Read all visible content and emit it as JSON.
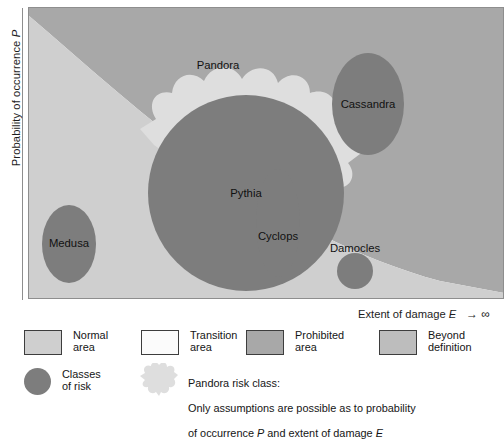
{
  "axes": {
    "y_label_prefix": "Probability of occurrence ",
    "y_label_symbol": "P",
    "x_label_prefix": "Extent of damage ",
    "x_label_symbol": "E",
    "x_label_arrow": "→ ∞"
  },
  "colors": {
    "normal_area": "#cfcfcf",
    "transition_area": "#fbfbfb",
    "prohibited_area": "#a8a8a8",
    "beyond_definition": "#bdbdbd",
    "pandora_blob": "#dedede",
    "risk_class_circle": "#7d7d7d",
    "label_text": "#111111",
    "plot_border": "#8e8e8e"
  },
  "chart_data": {
    "type": "diagram",
    "title": "",
    "xlabel": "Extent of damage E",
    "ylabel": "Probability of occurrence P",
    "regions": [
      {
        "name": "Normal area",
        "color": "#cfcfcf"
      },
      {
        "name": "Transition area",
        "color": "#fbfbfb"
      },
      {
        "name": "Prohibited area",
        "color": "#a8a8a8"
      },
      {
        "name": "Beyond definition",
        "color": "#bdbdbd"
      },
      {
        "name": "Pandora blob",
        "color": "#dedede"
      }
    ],
    "risk_classes": [
      {
        "name": "Pythia",
        "cx": 218,
        "cy": 186,
        "rx": 98,
        "ry": 98,
        "label_x": 218,
        "label_y": 190
      },
      {
        "name": "Cassandra",
        "cx": 340,
        "cy": 97,
        "rx": 36,
        "ry": 51,
        "label_x": 340,
        "label_y": 101
      },
      {
        "name": "Cyclops",
        "cx": 250,
        "cy": 216,
        "rx": 22,
        "ry": 54,
        "label_x": 250,
        "label_y": 233
      },
      {
        "name": "Medusa",
        "cx": 41,
        "cy": 237,
        "rx": 27,
        "ry": 39,
        "label_x": 41,
        "label_y": 240
      },
      {
        "name": "Damocles",
        "cx": 327,
        "cy": 264,
        "rx": 18,
        "ry": 18,
        "label_x": 327,
        "label_y": 245
      }
    ],
    "pandora_label": {
      "name": "Pandora",
      "label_x": 190,
      "label_y": 62
    }
  },
  "legend": {
    "row1": [
      {
        "swatch": "rect",
        "fill": "#cfcfcf",
        "label": "Normal\narea"
      },
      {
        "swatch": "rect",
        "fill": "#fbfbfb",
        "label": "Transition\narea"
      },
      {
        "swatch": "rect",
        "fill": "#a8a8a8",
        "label": "Prohibited\narea"
      },
      {
        "swatch": "rect",
        "fill": "#bdbdbd",
        "label": "Beyond\ndefinition"
      }
    ],
    "row2": {
      "classes_swatch": "circle",
      "classes_label": "Classes\nof risk",
      "pandora_title": "Pandora risk class:",
      "pandora_line2_a": "Only assumptions are possible as to probability",
      "pandora_line3_a": "of occurrence ",
      "pandora_line3_sym1": "P",
      "pandora_line3_b": " and extent of damage ",
      "pandora_line3_sym2": "E"
    }
  }
}
